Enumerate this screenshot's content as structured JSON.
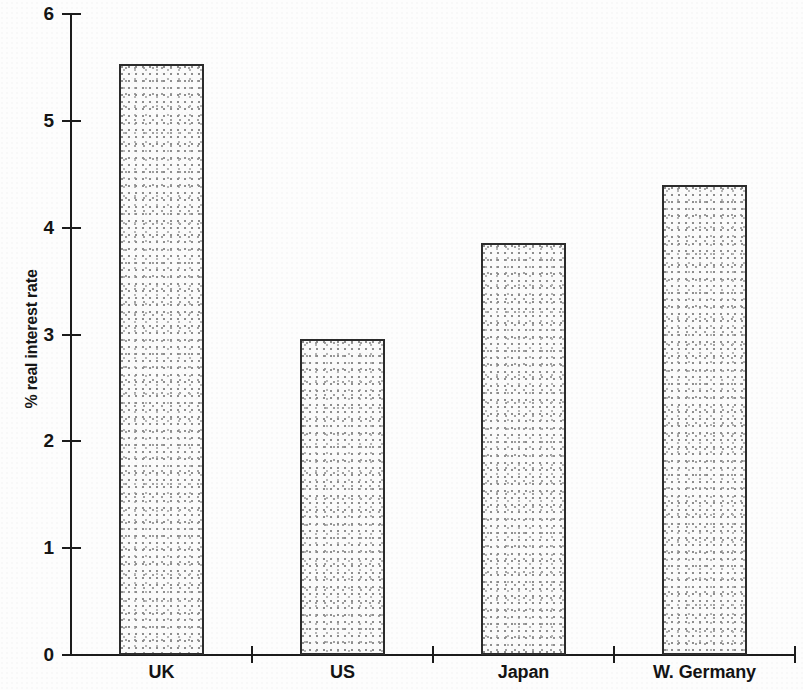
{
  "chart_data": {
    "type": "bar",
    "title": "",
    "subtitle": "",
    "xlabel": "",
    "ylabel": "% real interest rate",
    "categories": [
      "UK",
      "US",
      "Japan",
      "W. Germany"
    ],
    "values": [
      5.53,
      2.96,
      3.86,
      4.4
    ],
    "series": [
      {
        "name": "% real interest rate",
        "values": [
          5.53,
          2.96,
          3.86,
          4.4
        ]
      }
    ],
    "ylim": [
      0,
      6
    ],
    "xlim": [
      0,
      4
    ],
    "ytick_labels": [
      "0",
      "1",
      "2",
      "3",
      "4",
      "5",
      "6"
    ],
    "ytick_values": [
      0,
      1,
      2,
      3,
      4,
      5,
      6
    ],
    "grid": false,
    "legend": false,
    "legend_position": "none",
    "bar_fill": "#efefef",
    "bar_border_color": "#2b2b2b",
    "axis_color": "#1b1b1b",
    "background_color": "#fdfdfd",
    "annotations": []
  }
}
